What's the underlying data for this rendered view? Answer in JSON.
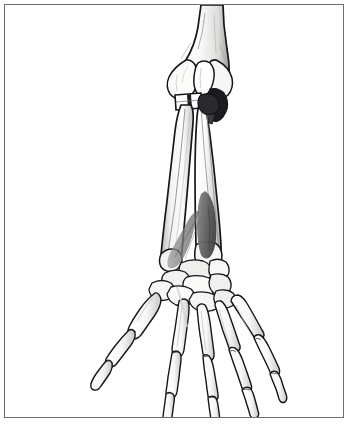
{
  "figure": {
    "title": "Anatomical illustration of right forearm and hand skeleton, anterior view",
    "caption": "",
    "view": "anterior",
    "style": "line-drawing-with-grayscale-shading",
    "background_color": "#ffffff",
    "border_color": "#6e6e70",
    "outline_color": "#15151a",
    "bone_fill_color": "#fcfcfa",
    "bone_shade_color": "#d8d8d6",
    "bone_shade_deep_color": "#a9a9a7",
    "muscle_highlight_color": "#6f6f70",
    "muscle_highlight_dark_color": "#4b4b4d",
    "joint_dark_color": "#1a1a1e"
  },
  "structures": {
    "humerus": {
      "name": "Humerus",
      "region": "upper-arm",
      "visible_portion": "distal shaft and condyles, cut off at top edge"
    },
    "radius": {
      "name": "Radius",
      "region": "forearm-lateral",
      "visible_portion": "full length, head to distal end"
    },
    "ulna": {
      "name": "Ulna",
      "region": "forearm-medial",
      "visible_portion": "olecranon to ulnar head"
    },
    "carpals": {
      "name": "Carpal bones",
      "region": "wrist",
      "count": 8
    },
    "metacarpals": {
      "name": "Metacarpals",
      "region": "hand",
      "count": 5
    },
    "phalanges": {
      "name": "Phalanges",
      "region": "fingers-and-thumb",
      "count": 14
    },
    "highlighted_muscle": {
      "name": "Highlighted muscle (shaded)",
      "region": "distal-anterior-forearm",
      "shading": "dark gray fill between radius and ulna"
    }
  },
  "labels": []
}
